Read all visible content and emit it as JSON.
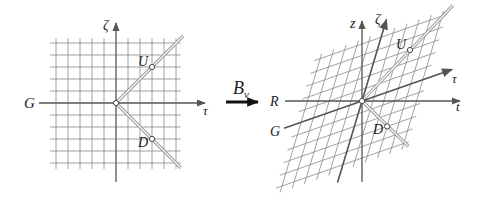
{
  "colors": {
    "grid": "#8a8a8a",
    "axis": "#555555",
    "lightcone_outer": "#9a9a9a",
    "lightcone_inner": "#ffffff",
    "arrow": "#111111",
    "text": "#222222"
  },
  "left_panel": {
    "origin": [
      116,
      103
    ],
    "unit": 12,
    "grid_range": [
      -5.5,
      5.4
    ],
    "axes": {
      "horizontal_label": "G",
      "horizontal_arrow_label": "τ",
      "vertical_label": "ζ"
    },
    "events": [
      {
        "name": "U",
        "tau": 3,
        "zeta": 3
      },
      {
        "name": "D",
        "tau": 3,
        "zeta": -3
      }
    ]
  },
  "transform": {
    "label": "B",
    "subscript": "v"
  },
  "right_panel": {
    "origin": [
      362,
      101
    ],
    "tau_unit": [
      12.18,
      -4.26
    ],
    "zeta_unit": [
      3.82,
      -12.74
    ],
    "grid_range": [
      -5.5,
      5.4
    ],
    "axes": {
      "rest_horizontal_left_label": "R",
      "rest_horizontal_right_label": "t",
      "rest_vertical_label": "z",
      "boosted_time_label": "τ",
      "boosted_space_label": "ζ",
      "boosted_left_label": "G"
    },
    "events": [
      {
        "name": "U",
        "tau": 3,
        "zeta": 3
      },
      {
        "name": "D",
        "tau": 3,
        "zeta": -3
      }
    ]
  }
}
